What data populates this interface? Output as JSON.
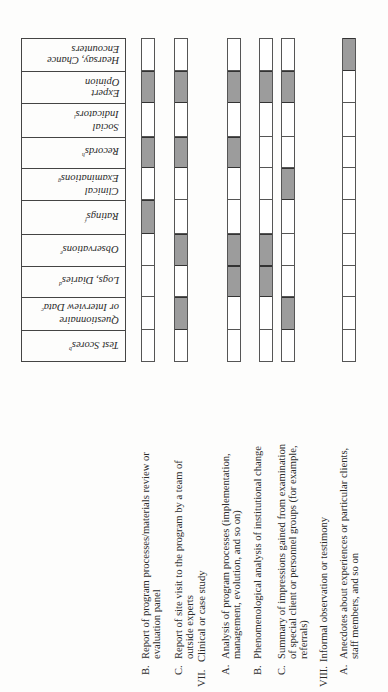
{
  "table": {
    "columns": [
      {
        "label": "Hearsay, Chance\nEncounters",
        "line1": "Hearsay, Chance",
        "line2": "Encounters",
        "note": ""
      },
      {
        "label": "Expert Opinion",
        "line1": "Expert",
        "line2": "Opinion",
        "note": ""
      },
      {
        "label": "Social Indicators",
        "line1": "Social",
        "line2": "Indicators",
        "note": "i"
      },
      {
        "label": "Records",
        "line1": "Records",
        "line2": "",
        "note": "h"
      },
      {
        "label": "Clinical Examinations",
        "line1": "Clinical",
        "line2": "Examinations",
        "note": "g"
      },
      {
        "label": "Ratings",
        "line1": "Ratings",
        "line2": "",
        "note": "f"
      },
      {
        "label": "Observations",
        "line1": "Observations",
        "line2": "",
        "note": "e"
      },
      {
        "label": "Logs, Diaries",
        "line1": "Logs, Diaries",
        "line2": "",
        "note": "d"
      },
      {
        "label": "Questionnaire or Interview Data",
        "line1": "Questionnaire",
        "line2": "or Interview Data",
        "note": "c"
      },
      {
        "label": "Test Scores",
        "line1": "Test Scores",
        "line2": "",
        "note": "b"
      }
    ],
    "row_bounds_y": [
      38,
      71,
      103,
      137,
      168,
      200,
      234,
      266,
      297,
      330,
      362
    ]
  },
  "items": [
    {
      "id": "VI.B",
      "num": "B.",
      "lines": [
        "Report of program processes/materials review or",
        "evaluation panel"
      ],
      "shaded": [
        false,
        true,
        false,
        true,
        false,
        true,
        false,
        false,
        false,
        false
      ]
    },
    {
      "id": "VI.C",
      "num": "C.",
      "lines": [
        "Report of site visit to the program by a team of",
        "outside experts"
      ],
      "shaded": [
        false,
        true,
        false,
        true,
        false,
        false,
        true,
        false,
        true,
        false
      ]
    },
    {
      "id": "VII",
      "roman": "VII.",
      "heading": "Clinical or case study"
    },
    {
      "id": "VII.A",
      "num": "A.",
      "lines": [
        "Analysis of program processes (implementation,",
        "management, evolution, and so on)"
      ],
      "shaded": [
        false,
        true,
        false,
        true,
        false,
        false,
        true,
        true,
        false,
        false
      ]
    },
    {
      "id": "VII.B",
      "num": "B.",
      "lines": [
        "Phenomenological analysis of institutional change"
      ],
      "shaded": [
        false,
        true,
        false,
        false,
        false,
        false,
        true,
        true,
        false,
        false
      ]
    },
    {
      "id": "VII.C",
      "num": "C.",
      "lines": [
        "Summary of impressions gained from examination",
        "of special client or personnel groups (for example,",
        "referrals)"
      ],
      "shaded": [
        false,
        true,
        false,
        false,
        true,
        false,
        false,
        false,
        true,
        false
      ]
    },
    {
      "id": "VIII",
      "roman": "VIII.",
      "heading": "Informal  observation  or  testimony"
    },
    {
      "id": "VIII.A",
      "num": "A.",
      "lines": [
        "Anecdotes about experiences or particular clients,",
        "staff members, and so on"
      ],
      "shaded": [
        true,
        false,
        false,
        false,
        false,
        false,
        false,
        false,
        false,
        false
      ]
    }
  ],
  "colors": {
    "shade": "#9c9c9c",
    "border": "#444444",
    "text": "#2a2a2a",
    "paper": "#fdfdfc"
  }
}
